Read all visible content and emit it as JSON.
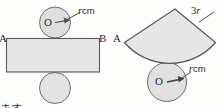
{
  "page": {
    "background_color": "#fdfdfc",
    "ink_color": "#4a4a4a",
    "fill_color": "#e5e5e5",
    "text_color": "#2b2b2b"
  },
  "figure_left": {
    "name": "cylinder-net",
    "point_a_label": "A",
    "point_b_label": "B",
    "center_label": "O",
    "radius_label_italic": "r",
    "radius_label_unit": "cm",
    "top_circle": {
      "cx": 55,
      "cy": 23,
      "r": 15
    },
    "bottom_circle": {
      "cx": 55,
      "cy": 88,
      "r": 15
    },
    "rectangle": {
      "x": 6,
      "y": 38,
      "width": 94,
      "height": 34
    },
    "leader_line": {
      "x1": 63,
      "y1": 22,
      "x2": 80,
      "y2": 13
    },
    "radius_arrow": {
      "x1": 55,
      "y1": 23,
      "x2": 68,
      "y2": 20
    }
  },
  "figure_right": {
    "name": "cone-net",
    "point_a_label": "A",
    "center_label": "O",
    "slant_label_number": "3",
    "slant_label_italic": "r",
    "radius_label_italic": "r",
    "radius_label_unit": "cm",
    "sector": {
      "apex_x": 175,
      "apex_y": 9,
      "radius": 58,
      "start_deg": 122,
      "end_deg": 58
    },
    "base_circle": {
      "cx": 167,
      "cy": 82,
      "r": 19
    },
    "slant_leader": {
      "x1": 203,
      "y1": 20,
      "x2": 216,
      "y2": 13
    },
    "radius_arrow": {
      "x1": 167,
      "y1": 82,
      "x2": 186,
      "y2": 77
    },
    "radius_leader": {
      "x1": 186,
      "y1": 77,
      "x2": 194,
      "y2": 72
    }
  },
  "caption": {
    "text": "ます"
  }
}
